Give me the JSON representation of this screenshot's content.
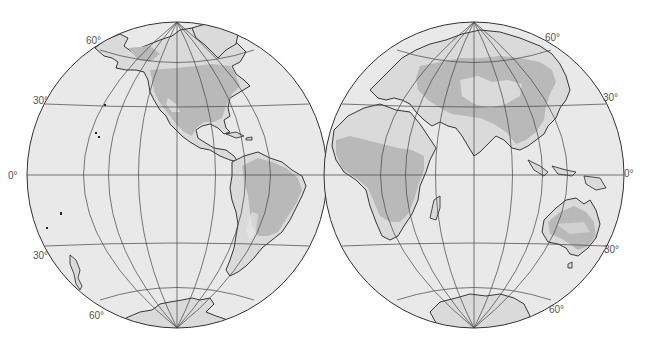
{
  "map": {
    "type": "world map, two-hemisphere orthographic projection",
    "hemispheres": [
      {
        "name": "Western Hemisphere",
        "continents": [
          "North America",
          "South America",
          "Antarctica"
        ],
        "labels": {
          "lat60_north": "60°",
          "lat30_north": "30°",
          "equator": "0°",
          "lat30_south": "30°",
          "lat60_south": "60°"
        }
      },
      {
        "name": "Eastern Hemisphere",
        "continents": [
          "Europe",
          "Asia",
          "Africa",
          "Australia",
          "Antarctica"
        ],
        "labels": {
          "lat60_north": "60°",
          "lat30_north": "30°",
          "equator": "0°",
          "lat30_south": "30°",
          "lat60_south": "60°"
        }
      }
    ],
    "colors": {
      "ocean": "#e9e9e9",
      "land": "#dadada",
      "shaded_region": "#b9b9b9",
      "grid": "#444444",
      "outline": "#222222",
      "label": "#555555"
    }
  }
}
